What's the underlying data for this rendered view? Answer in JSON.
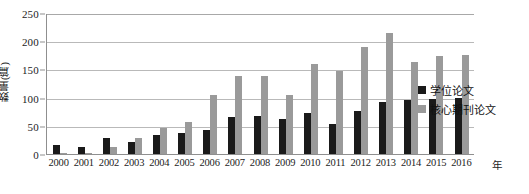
{
  "chart_data": {
    "type": "bar",
    "title": "",
    "xlabel": "年",
    "ylabel": "数量(篇)",
    "ylim": [
      0,
      250
    ],
    "yticks": [
      0,
      50,
      100,
      150,
      200,
      250
    ],
    "grid": true,
    "legend_position": "right",
    "categories": [
      "2000",
      "2001",
      "2002",
      "2003",
      "2004",
      "2005",
      "2006",
      "2007",
      "2008",
      "2009",
      "2010",
      "2011",
      "2012",
      "2013",
      "2014",
      "2015",
      "2016"
    ],
    "series": [
      {
        "name": "学位论文",
        "color": "#1a1a1a",
        "values": [
          16,
          13,
          28,
          22,
          33,
          38,
          43,
          65,
          67,
          62,
          73,
          54,
          76,
          92,
          95,
          97,
          100
        ]
      },
      {
        "name": "核心期刊论文",
        "color": "#9a9a9a",
        "values": [
          1,
          2,
          13,
          29,
          47,
          56,
          105,
          139,
          139,
          105,
          160,
          147,
          189,
          215,
          163,
          174,
          175
        ]
      }
    ]
  },
  "legend": {
    "items": [
      {
        "label": "学位论文",
        "swatch": "black-square-icon"
      },
      {
        "label": "核心期刊论文",
        "swatch": "gray-square-icon"
      }
    ]
  },
  "axes": {
    "y_title": "数量(篇)",
    "x_title": "年",
    "y_tick_labels": [
      "250",
      "200",
      "150",
      "100",
      "50",
      "0"
    ],
    "x_tick_labels": [
      "2000",
      "2001",
      "2002",
      "2003",
      "2004",
      "2005",
      "2006",
      "2007",
      "2008",
      "2009",
      "2010",
      "2011",
      "2012",
      "2013",
      "2014",
      "2015",
      "2016"
    ]
  }
}
